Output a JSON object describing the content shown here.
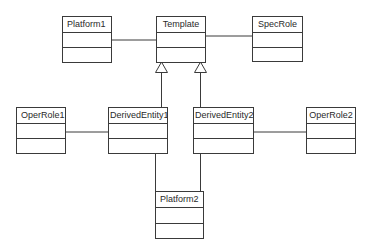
{
  "diagram": {
    "type": "UML class diagram",
    "classes": [
      {
        "id": "platform1",
        "name": "Platform1"
      },
      {
        "id": "template",
        "name": "Template"
      },
      {
        "id": "specrole",
        "name": "SpecRole"
      },
      {
        "id": "operrole1",
        "name": "OperRole1"
      },
      {
        "id": "derivedentity1",
        "name": "DerivedEntity1"
      },
      {
        "id": "derivedentity2",
        "name": "DerivedEntity2"
      },
      {
        "id": "operrole2",
        "name": "OperRole2"
      },
      {
        "id": "platform2",
        "name": "Platform2"
      }
    ],
    "relationships": [
      {
        "type": "association",
        "from": "Platform1",
        "to": "Template"
      },
      {
        "type": "association",
        "from": "Template",
        "to": "SpecRole"
      },
      {
        "type": "generalization",
        "from": "DerivedEntity1",
        "to": "Template"
      },
      {
        "type": "generalization",
        "from": "DerivedEntity2",
        "to": "Template"
      },
      {
        "type": "association",
        "from": "OperRole1",
        "to": "DerivedEntity1"
      },
      {
        "type": "association",
        "from": "DerivedEntity2",
        "to": "OperRole2"
      },
      {
        "type": "association",
        "from": "DerivedEntity1",
        "to": "Platform2"
      },
      {
        "type": "association",
        "from": "DerivedEntity2",
        "to": "Platform2"
      }
    ],
    "colors": {
      "line": "#3a3a3a",
      "background": "#ffffff",
      "text": "#2a2a2a"
    }
  }
}
